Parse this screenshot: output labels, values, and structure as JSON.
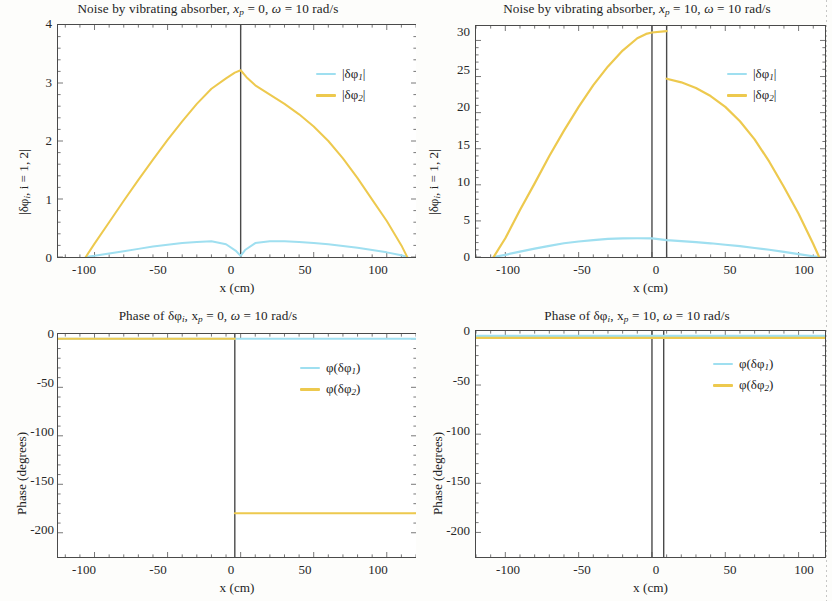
{
  "figure": {
    "xlabel": "x (cm)",
    "amp_ylabel_pre": "|δφ",
    "amp_ylabel_sub": "i",
    "amp_ylabel_post": ", i = 1, 2|",
    "phase_ylabel": "Phase (degrees)"
  },
  "panels": [
    {
      "id": "amplitude-xp0",
      "title_pre": "Noise by vibrating absorber, ",
      "title_var": "x",
      "title_sub": "p",
      "title_mid": " = 0, ",
      "title_omega": "ω",
      "title_post": " = 10 rad/s",
      "legend": [
        {
          "label_pre": "|δφ",
          "label_sub": "1",
          "label_post": "|",
          "color": "#9fdff0"
        },
        {
          "label_pre": "|δφ",
          "label_sub": "2",
          "label_post": "|",
          "color": "#edc94e"
        }
      ],
      "xticks": [
        "-100",
        "-50",
        "0",
        "50",
        "100"
      ],
      "yticks": [
        "0",
        "1",
        "2",
        "3",
        "4"
      ]
    },
    {
      "id": "amplitude-xp10",
      "title_pre": "Noise by vibrating absorber, ",
      "title_var": "x",
      "title_sub": "p",
      "title_mid": " = 10, ",
      "title_omega": "ω",
      "title_post": " = 10 rad/s",
      "legend": [
        {
          "label_pre": "|δφ",
          "label_sub": "1",
          "label_post": "|",
          "color": "#9fdff0"
        },
        {
          "label_pre": "|δφ",
          "label_sub": "2",
          "label_post": "|",
          "color": "#edc94e"
        }
      ],
      "xticks": [
        "-100",
        "-50",
        "0",
        "50",
        "100"
      ],
      "yticks": [
        "0",
        "5",
        "10",
        "15",
        "20",
        "25",
        "30"
      ]
    },
    {
      "id": "phase-xp0",
      "title_pre": "Phase of δφ",
      "title_var": "i",
      "title_sub": "",
      "title_mid": ", x",
      "title_subp": "p",
      "title_eq": " = 0, ",
      "title_omega": "ω",
      "title_post": " = 10 rad/s",
      "legend": [
        {
          "label_pre": "φ(δφ",
          "label_sub": "1",
          "label_post": ")",
          "color": "#9fdff0"
        },
        {
          "label_pre": "φ(δφ",
          "label_sub": "2",
          "label_post": ")",
          "color": "#edc94e"
        }
      ],
      "xticks": [
        "-100",
        "-50",
        "0",
        "50",
        "100"
      ],
      "yticks": [
        "0",
        "-50",
        "-100",
        "-150",
        "-200"
      ]
    },
    {
      "id": "phase-xp10",
      "title_pre": "Phase of δφ",
      "title_var": "i",
      "title_sub": "",
      "title_mid": ", x",
      "title_subp": "p",
      "title_eq": " = 10, ",
      "title_omega": "ω",
      "title_post": " = 10 rad/s",
      "legend": [
        {
          "label_pre": "φ(δφ",
          "label_sub": "1",
          "label_post": ")",
          "color": "#9fdff0"
        },
        {
          "label_pre": "φ(δφ",
          "label_sub": "2",
          "label_post": ")",
          "color": "#edc94e"
        }
      ],
      "xticks": [
        "-100",
        "-50",
        "0",
        "50",
        "100"
      ],
      "yticks": [
        "0",
        "-50",
        "-100",
        "-150",
        "-200"
      ]
    }
  ],
  "chart_data": [
    {
      "type": "line",
      "id": "amplitude-xp0",
      "title": "Noise by vibrating absorber, x_p = 0, omega = 10 rad/s",
      "xlabel": "x (cm)",
      "ylabel": "|delta phi_i, i = 1, 2|",
      "xlim": [
        -125,
        120
      ],
      "ylim": [
        0,
        4
      ],
      "xticks": [
        -100,
        -50,
        0,
        50,
        100
      ],
      "yticks": [
        0,
        1,
        2,
        3,
        4
      ],
      "grid": false,
      "legend_position": "upper-right",
      "vertical_markers": [
        0
      ],
      "series": [
        {
          "name": "|delta phi_1|",
          "color": "#9fdff0",
          "x": [
            -106,
            -100,
            -90,
            -80,
            -70,
            -60,
            -50,
            -40,
            -30,
            -20,
            -10,
            -3,
            0,
            3,
            10,
            20,
            30,
            40,
            50,
            60,
            70,
            80,
            90,
            100,
            110,
            114
          ],
          "y": [
            0.0,
            0.02,
            0.06,
            0.1,
            0.14,
            0.18,
            0.21,
            0.24,
            0.26,
            0.27,
            0.22,
            0.1,
            0.02,
            0.12,
            0.24,
            0.27,
            0.27,
            0.26,
            0.24,
            0.22,
            0.19,
            0.16,
            0.12,
            0.08,
            0.03,
            0.0
          ]
        },
        {
          "name": "|delta phi_2|",
          "color": "#edc94e",
          "x": [
            -106,
            -100,
            -90,
            -80,
            -70,
            -60,
            -50,
            -40,
            -30,
            -20,
            -10,
            -4,
            0,
            4,
            10,
            20,
            30,
            40,
            50,
            60,
            70,
            80,
            90,
            100,
            110,
            114
          ],
          "y": [
            0.0,
            0.23,
            0.6,
            0.97,
            1.33,
            1.68,
            2.02,
            2.34,
            2.64,
            2.9,
            3.08,
            3.18,
            3.22,
            3.1,
            2.96,
            2.8,
            2.64,
            2.46,
            2.25,
            2.0,
            1.7,
            1.36,
            0.99,
            0.62,
            0.2,
            0.0
          ]
        }
      ]
    },
    {
      "type": "line",
      "id": "amplitude-xp10",
      "title": "Noise by vibrating absorber, x_p = 10, omega = 10 rad/s",
      "xlabel": "x (cm)",
      "ylabel": "|delta phi_i, i = 1, 2|",
      "xlim": [
        -120,
        118
      ],
      "ylim": [
        0,
        32
      ],
      "xticks": [
        -100,
        -50,
        0,
        50,
        100
      ],
      "yticks": [
        0,
        5,
        10,
        15,
        20,
        25,
        30
      ],
      "grid": false,
      "legend_position": "upper-right",
      "vertical_markers": [
        0,
        10
      ],
      "series": [
        {
          "name": "|delta phi_1|",
          "color": "#9fdff0",
          "x": [
            -108,
            -100,
            -90,
            -80,
            -70,
            -60,
            -50,
            -40,
            -30,
            -20,
            -10,
            0,
            10,
            20,
            30,
            40,
            50,
            60,
            70,
            80,
            90,
            100,
            110,
            114
          ],
          "y": [
            0.0,
            0.3,
            0.75,
            1.15,
            1.55,
            1.9,
            2.15,
            2.35,
            2.5,
            2.58,
            2.6,
            2.58,
            2.35,
            2.2,
            2.05,
            1.9,
            1.7,
            1.5,
            1.25,
            1.0,
            0.7,
            0.4,
            0.1,
            0.0
          ]
        },
        {
          "name": "|delta phi_2|",
          "color": "#edc94e",
          "x": [
            -108,
            -100,
            -90,
            -80,
            -70,
            -60,
            -50,
            -40,
            -30,
            -20,
            -10,
            -4,
            0,
            10,
            10,
            20,
            30,
            40,
            50,
            60,
            70,
            80,
            90,
            100,
            110,
            114
          ],
          "y": [
            0.0,
            2.6,
            6.5,
            10.2,
            14.0,
            17.5,
            20.8,
            23.8,
            26.4,
            28.6,
            30.3,
            30.9,
            31.1,
            31.3,
            24.7,
            24.2,
            23.4,
            22.3,
            20.8,
            18.8,
            16.3,
            13.2,
            9.7,
            6.0,
            1.8,
            0.0
          ]
        }
      ]
    },
    {
      "type": "line",
      "id": "phase-xp0",
      "title": "Phase of delta phi_i, x_p = 0, omega = 10 rad/s",
      "xlabel": "x (cm)",
      "ylabel": "Phase (degrees)",
      "xlim": [
        -125,
        120
      ],
      "ylim": [
        -225,
        5
      ],
      "xticks": [
        -100,
        -50,
        0,
        50,
        100
      ],
      "yticks": [
        0,
        -50,
        -100,
        -150,
        -200
      ],
      "grid": false,
      "legend_position": "upper-right",
      "vertical_markers": [
        -4
      ],
      "series": [
        {
          "name": "phi(delta phi_1)",
          "color": "#9fdff0",
          "x": [
            -125,
            -4,
            120
          ],
          "y": [
            0,
            0,
            0
          ]
        },
        {
          "name": "phi(delta phi_2)",
          "color": "#edc94e",
          "x": [
            -125,
            -4,
            -4,
            120
          ],
          "y": [
            0,
            0,
            -180,
            -180
          ]
        }
      ]
    },
    {
      "type": "line",
      "id": "phase-xp10",
      "title": "Phase of delta phi_i, x_p = 10, omega = 10 rad/s",
      "xlabel": "x (cm)",
      "ylabel": "Phase (degrees)",
      "xlim": [
        -120,
        118
      ],
      "ylim": [
        -225,
        5
      ],
      "xticks": [
        -100,
        -50,
        0,
        50,
        100
      ],
      "yticks": [
        0,
        -50,
        -100,
        -150,
        -200
      ],
      "grid": false,
      "legend_position": "upper-right",
      "vertical_markers": [
        0,
        8
      ],
      "series": [
        {
          "name": "phi(delta phi_1)",
          "color": "#9fdff0",
          "x": [
            -120,
            118
          ],
          "y": [
            0,
            0
          ]
        },
        {
          "name": "phi(delta phi_2)",
          "color": "#edc94e",
          "x": [
            -120,
            118
          ],
          "y": [
            -2,
            -2
          ]
        }
      ]
    }
  ]
}
